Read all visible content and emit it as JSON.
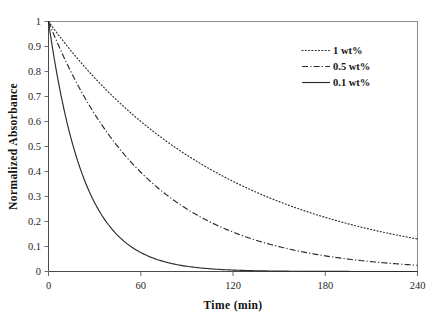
{
  "chart_data": {
    "type": "line",
    "title": "",
    "xlabel": "Time (min)",
    "ylabel": "Normalized Absorbance",
    "xlim": [
      0,
      240
    ],
    "ylim": [
      0,
      1
    ],
    "xticks": [
      "0",
      "60",
      "120",
      "180",
      "240"
    ],
    "xtick_values": [
      0,
      60,
      120,
      180,
      240
    ],
    "yticks": [
      "0",
      "0.1",
      "0.2",
      "0.3",
      "0.4",
      "0.5",
      "0.6",
      "0.7",
      "0.8",
      "0.9",
      "1"
    ],
    "ytick_values": [
      0,
      0.1,
      0.2,
      0.3,
      0.4,
      0.5,
      0.6,
      0.7,
      0.8,
      0.9,
      1
    ],
    "grid": false,
    "legend_position": "top-right",
    "x": [
      0,
      10,
      20,
      30,
      40,
      50,
      60,
      70,
      80,
      90,
      100,
      110,
      120,
      130,
      140,
      150,
      160,
      170,
      180,
      190,
      200,
      210,
      220,
      230,
      240
    ],
    "series": [
      {
        "name": "1 wt%",
        "style": "dotted",
        "color": "#2b2b2b",
        "decay_rate": 0.0085,
        "values": [
          1.0,
          0.919,
          0.844,
          0.775,
          0.712,
          0.654,
          0.6,
          0.551,
          0.507,
          0.466,
          0.427,
          0.393,
          0.361,
          0.331,
          0.304,
          0.279,
          0.257,
          0.236,
          0.217,
          0.199,
          0.183,
          0.168,
          0.154,
          0.142,
          0.08
        ]
      },
      {
        "name": "0.5 wt%",
        "style": "dash-dot",
        "color": "#2b2b2b",
        "decay_rate": 0.0154,
        "values": [
          1.0,
          0.857,
          0.734,
          0.629,
          0.54,
          0.463,
          0.396,
          0.34,
          0.291,
          0.25,
          0.214,
          0.183,
          0.157,
          0.135,
          0.115,
          0.099,
          0.085,
          0.073,
          0.062,
          0.054,
          0.046,
          0.039,
          0.034,
          0.029,
          0.012
        ]
      },
      {
        "name": "0.1 wt%",
        "style": "solid",
        "color": "#2b2b2b",
        "decay_rate": 0.043,
        "values": [
          1.0,
          0.651,
          0.423,
          0.275,
          0.179,
          0.117,
          0.076,
          0.049,
          0.032,
          0.021,
          0.014,
          0.009,
          0.006,
          0.004,
          0.002,
          0.002,
          0.001,
          0.001,
          0.0,
          0.0,
          0.0,
          0.0,
          0.0,
          0.0,
          0.0
        ]
      }
    ]
  },
  "legend": {
    "items": [
      {
        "label": "1 wt%",
        "style": "dotted"
      },
      {
        "label": "0.5 wt%",
        "style": "dash-dot"
      },
      {
        "label": "0.1 wt%",
        "style": "solid"
      }
    ]
  }
}
